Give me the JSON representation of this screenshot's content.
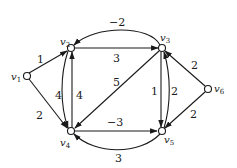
{
  "graph": {
    "type": "directed-weighted",
    "nodes": [
      {
        "id": "v1",
        "label": "v",
        "sub": "1"
      },
      {
        "id": "v2",
        "label": "v",
        "sub": "2"
      },
      {
        "id": "v3",
        "label": "v",
        "sub": "3"
      },
      {
        "id": "v4",
        "label": "v",
        "sub": "4"
      },
      {
        "id": "v5",
        "label": "v",
        "sub": "5"
      },
      {
        "id": "v6",
        "label": "v",
        "sub": "6"
      }
    ],
    "edges": [
      {
        "from": "v1",
        "to": "v2",
        "weight": "1"
      },
      {
        "from": "v1",
        "to": "v4",
        "weight": "2"
      },
      {
        "from": "v3",
        "to": "v2",
        "weight": "−2"
      },
      {
        "from": "v2",
        "to": "v3",
        "weight": "3"
      },
      {
        "from": "v2",
        "to": "v4",
        "weight": "4"
      },
      {
        "from": "v4",
        "to": "v2",
        "weight": "4"
      },
      {
        "from": "v3",
        "to": "v4",
        "weight": "5"
      },
      {
        "from": "v3",
        "to": "v5",
        "weight": "1"
      },
      {
        "from": "v5",
        "to": "v3",
        "weight": "2"
      },
      {
        "from": "v4",
        "to": "v5",
        "weight": "−3"
      },
      {
        "from": "v5",
        "to": "v4",
        "weight": "3"
      },
      {
        "from": "v6",
        "to": "v3",
        "weight": "2"
      },
      {
        "from": "v6",
        "to": "v5",
        "weight": "2"
      }
    ]
  }
}
